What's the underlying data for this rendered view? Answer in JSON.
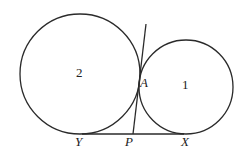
{
  "diagram": {
    "circles": [
      {
        "id": "circle-2",
        "label": "2",
        "cx": 80,
        "cy": 74,
        "r": 60
      },
      {
        "id": "circle-1",
        "label": "1",
        "cx": 186,
        "cy": 87,
        "r": 47
      }
    ],
    "points": {
      "A": {
        "label": "A",
        "x": 139,
        "y": 86
      },
      "Y": {
        "label": "Y",
        "x": 80,
        "y": 134
      },
      "P": {
        "label": "P",
        "x": 133,
        "y": 134
      },
      "X": {
        "label": "X",
        "x": 186,
        "y": 134
      }
    },
    "lines": [
      {
        "id": "tangent-YX",
        "x1": 80,
        "y1": 134,
        "x2": 186,
        "y2": 134
      },
      {
        "id": "tangent-through-A",
        "x1": 146,
        "y1": 24,
        "x2": 133,
        "y2": 134
      }
    ],
    "labels": {
      "circle_2": "2",
      "circle_1": "1",
      "point_A": "A",
      "point_Y": "Y",
      "point_P": "P",
      "point_X": "X"
    },
    "stroke_color": "#2a2a2a",
    "background": "#ffffff"
  }
}
